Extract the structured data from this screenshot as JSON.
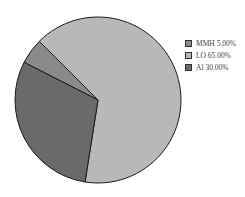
{
  "chart_data": {
    "type": "pie",
    "title": "",
    "categories": [
      "MMH",
      "LO",
      "Al"
    ],
    "values": [
      5.0,
      65.0,
      30.0
    ],
    "unit": "%",
    "series": [
      {
        "name": "MMH",
        "value": 5.0,
        "label": "MMH 5.00%",
        "color": "#8a8a8a"
      },
      {
        "name": "LO",
        "value": 65.0,
        "label": "LO 65.00%",
        "color": "#b8b8b8"
      },
      {
        "name": "Al",
        "value": 30.0,
        "label": "Al 30.00%",
        "color": "#6a6a6a"
      }
    ],
    "start_angle_deg_clockwise_from_top": 297,
    "legend_position": "right",
    "grid": false
  },
  "legend": {
    "items": [
      {
        "label": "MMH 5.00%",
        "color": "#8a8a8a"
      },
      {
        "label": "LO 65.00%",
        "color": "#b8b8b8"
      },
      {
        "label": "Al 30.00%",
        "color": "#6a6a6a"
      }
    ]
  }
}
